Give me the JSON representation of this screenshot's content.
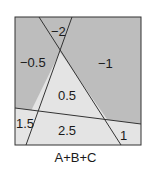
{
  "diagram": {
    "caption": "A+B+C",
    "colors": {
      "dark": "#bdbdbd",
      "light": "#e4e4e4",
      "line": "#333333"
    },
    "regions": [
      {
        "id": "top-small",
        "label": "−2"
      },
      {
        "id": "left",
        "label": "−0.5"
      },
      {
        "id": "right",
        "label": "−1"
      },
      {
        "id": "center",
        "label": "0.5"
      },
      {
        "id": "bottom-left",
        "label": "1.5"
      },
      {
        "id": "bottom-center",
        "label": "2.5"
      },
      {
        "id": "bottom-right",
        "label": "1"
      }
    ]
  }
}
